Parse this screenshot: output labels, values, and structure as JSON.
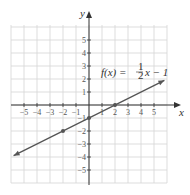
{
  "chart_data": {
    "type": "line",
    "title": "",
    "xlabel": "x",
    "ylabel": "y",
    "xlim": [
      -6,
      6
    ],
    "ylim": [
      -6,
      6
    ],
    "grid": true,
    "x_ticks": [
      -5,
      -4,
      -3,
      -2,
      -1,
      1,
      2,
      3,
      4,
      5
    ],
    "y_ticks": [
      5,
      4,
      3,
      2,
      1,
      -1,
      -2,
      -3,
      -4,
      -5
    ],
    "x_tick_labels": [
      "−5",
      "−4",
      "−3",
      "−2",
      "−1",
      "1",
      "2",
      "3",
      "4",
      "5"
    ],
    "y_tick_labels": [
      "5",
      "4",
      "3",
      "2",
      "1",
      "−1",
      "−2",
      "−3",
      "−4",
      "−5"
    ],
    "series": [
      {
        "name": "f(x) = 1/2 x − 1",
        "function": "f(x) = 0.5*x - 1",
        "x": [
          -5.8,
          5.8
        ],
        "y": [
          -3.9,
          1.9
        ],
        "points": [
          {
            "x": -2,
            "y": -2
          },
          {
            "x": 0,
            "y": -1
          },
          {
            "x": 2,
            "y": 0
          }
        ],
        "color": "#555555",
        "arrows_both_ends": true
      }
    ],
    "annotation": {
      "prefix": "f(x) = ",
      "frac_num": "1",
      "frac_den": "2",
      "suffix": "x − 1"
    }
  }
}
